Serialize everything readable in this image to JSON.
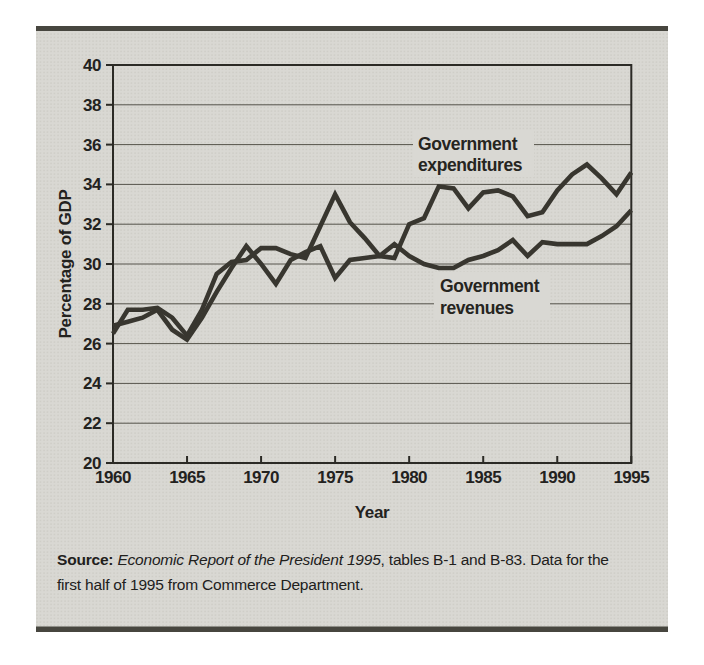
{
  "figure": {
    "source": {
      "prefix": "Source:",
      "title": " Economic Report of the President 1995",
      "rest": ", tables B-1 and B-83. Data for the",
      "line2": "first half of 1995 from Commerce Department."
    }
  },
  "chart_data": {
    "type": "line",
    "x": [
      1960,
      1961,
      1962,
      1963,
      1964,
      1965,
      1966,
      1967,
      1968,
      1969,
      1970,
      1971,
      1972,
      1973,
      1974,
      1975,
      1976,
      1977,
      1978,
      1979,
      1980,
      1981,
      1982,
      1983,
      1984,
      1985,
      1986,
      1987,
      1988,
      1989,
      1990,
      1991,
      1992,
      1993,
      1994,
      1995
    ],
    "series": [
      {
        "name": "Government expenditures",
        "label_lines": [
          "Government",
          "expenditures"
        ],
        "values": [
          26.5,
          27.7,
          27.7,
          27.8,
          27.3,
          26.4,
          27.7,
          29.5,
          30.1,
          30.2,
          30.8,
          30.8,
          30.5,
          30.3,
          31.9,
          33.5,
          32.1,
          31.3,
          30.4,
          30.3,
          32.0,
          32.3,
          33.9,
          33.8,
          32.8,
          33.6,
          33.7,
          33.4,
          32.4,
          32.6,
          33.7,
          34.5,
          35.0,
          34.3,
          33.5,
          34.6
        ]
      },
      {
        "name": "Government revenues",
        "label_lines": [
          "Government",
          "revenues"
        ],
        "values": [
          26.9,
          27.1,
          27.3,
          27.7,
          26.7,
          26.2,
          27.3,
          28.6,
          29.8,
          30.9,
          30.0,
          29.0,
          30.2,
          30.6,
          30.9,
          29.3,
          30.2,
          30.3,
          30.4,
          31.0,
          30.4,
          30.0,
          29.8,
          29.8,
          30.2,
          30.4,
          30.7,
          31.2,
          30.4,
          31.1,
          31.0,
          31.0,
          31.0,
          31.4,
          31.9,
          32.7
        ]
      }
    ],
    "xlabel": "Year",
    "ylabel": "Percentage of GDP",
    "ylim": [
      20,
      40
    ],
    "ytick_step": 2,
    "xticks": [
      1960,
      1965,
      1970,
      1975,
      1980,
      1985,
      1990,
      1995
    ],
    "yticks": [
      20,
      22,
      24,
      26,
      28,
      30,
      32,
      34,
      36,
      38,
      40
    ],
    "grid": true,
    "legend_position": "inline-labels",
    "line_color": "#38362f",
    "bg_color": "#d9d8d3",
    "frame_bar_color": "#47463f",
    "grid_color": "#55534b",
    "axis_color": "#2b2a25"
  }
}
